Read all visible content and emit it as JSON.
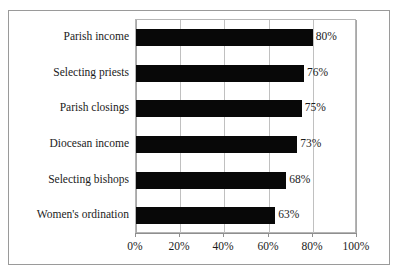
{
  "chart_data": {
    "type": "bar",
    "orientation": "horizontal",
    "title": "",
    "subtitle": "",
    "xlabel": "",
    "ylabel": "",
    "categories": [
      "Parish income",
      "Selecting priests",
      "Parish closings",
      "Diocesan income",
      "Selecting bishops",
      "Women's ordination"
    ],
    "values": [
      80,
      76,
      75,
      73,
      68,
      63
    ],
    "data_labels": [
      "80%",
      "76%",
      "75%",
      "73%",
      "68%",
      "63%"
    ],
    "xlim": [
      0,
      100
    ],
    "xticks": [
      0,
      20,
      40,
      60,
      80,
      100
    ],
    "xtick_labels": [
      "0%",
      "20%",
      "40%",
      "60%",
      "80%",
      "100%"
    ],
    "grid": "vertical",
    "legend": "none",
    "bar_color": "#080808",
    "gridline_color": "#c0c0c0",
    "frame_color": "#9a9a9a",
    "text_color": "#1b1b1b"
  }
}
